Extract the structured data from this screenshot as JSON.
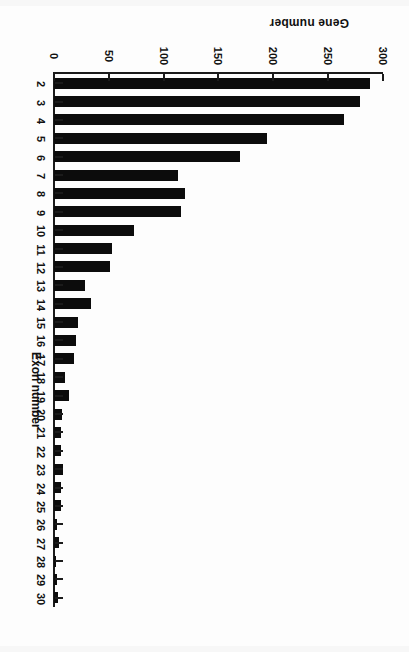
{
  "figure": {
    "orientation": "rotated-180",
    "background_color": "#ffffff",
    "bar_color": "#0c0c0c",
    "axis_color": "#1b1b1b"
  },
  "chart_data": {
    "type": "bar",
    "orientation": "horizontal",
    "title": "",
    "xlabel": "Exon number",
    "ylabel": "Gene number",
    "categories": [
      "2",
      "3",
      "4",
      "5",
      "6",
      "7",
      "8",
      "9",
      "10",
      "11",
      "12",
      "13",
      "14",
      "15",
      "16",
      "17",
      "18",
      "19",
      "20",
      "21",
      "22",
      "23",
      "24",
      "25",
      "26",
      "27",
      "28",
      "29",
      "30"
    ],
    "values": [
      288,
      279,
      264,
      194,
      170,
      113,
      119,
      116,
      73,
      53,
      51,
      28,
      34,
      22,
      20,
      18,
      10,
      14,
      7,
      6,
      6,
      8,
      6,
      6,
      3,
      5,
      2,
      3,
      4
    ],
    "ylim": [
      0,
      300
    ],
    "ytick_labels": [
      "0",
      "50",
      "100",
      "150",
      "200",
      "250",
      "300"
    ],
    "ytick_values": [
      0,
      50,
      100,
      150,
      200,
      250,
      300
    ],
    "grid": false,
    "legend": null
  },
  "axes": {
    "value_axis_label": "Gene number",
    "category_axis_label": "Exon number"
  }
}
